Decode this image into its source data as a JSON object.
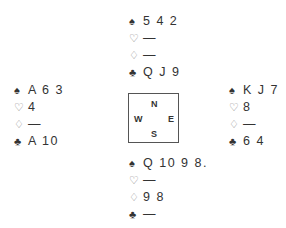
{
  "suits": {
    "spades": "♠",
    "hearts": "♡",
    "diamonds": "♢",
    "clubs": "♣"
  },
  "hands": {
    "north": {
      "spades": "5 4 2",
      "hearts": "—",
      "diamonds": "—",
      "clubs": "Q J 9"
    },
    "west": {
      "spades": "A 6 3",
      "hearts": "4",
      "diamonds": "—",
      "clubs": "A 10"
    },
    "east": {
      "spades": "K J 7",
      "hearts": "8",
      "diamonds": "—",
      "clubs": "6 4"
    },
    "south": {
      "spades": "Q 10 9 8.",
      "hearts": "—",
      "diamonds": "9 8",
      "clubs": "—"
    }
  },
  "compass": {
    "north": "N",
    "south": "S",
    "west": "W",
    "east": "E"
  }
}
